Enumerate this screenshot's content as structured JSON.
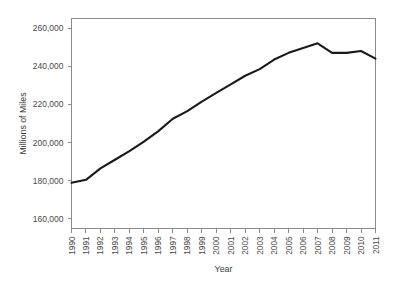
{
  "chart_data": {
    "type": "line",
    "title": "",
    "xlabel": "Year",
    "ylabel": "Millions of Miles",
    "x": [
      1990,
      1991,
      1992,
      1993,
      1994,
      1995,
      1996,
      1997,
      1998,
      1999,
      2000,
      2001,
      2002,
      2003,
      2004,
      2005,
      2006,
      2007,
      2008,
      2009,
      2010,
      2011
    ],
    "values": [
      179000,
      180500,
      186500,
      191000,
      195500,
      200500,
      206000,
      212500,
      216500,
      221500,
      226000,
      230500,
      235000,
      238500,
      243500,
      247000,
      249500,
      252000,
      247000,
      247000,
      248000,
      244000
    ],
    "series": [
      {
        "name": "Millions of Miles",
        "values": [
          179000,
          180500,
          186500,
          191000,
          195500,
          200500,
          206000,
          212500,
          216500,
          221500,
          226000,
          230500,
          235000,
          238500,
          243500,
          247000,
          249500,
          252000,
          247000,
          247000,
          248000,
          244000
        ]
      }
    ],
    "categories": [
      "1990",
      "1991",
      "1992",
      "1993",
      "1994",
      "1995",
      "1996",
      "1997",
      "1998",
      "1999",
      "2000",
      "2001",
      "2002",
      "2003",
      "2004",
      "2005",
      "2006",
      "2007",
      "2008",
      "2009",
      "2010",
      "2011"
    ],
    "xlim": [
      1990,
      2011
    ],
    "ylim": [
      155000,
      265000
    ],
    "y_ticks": [
      160000,
      180000,
      200000,
      220000,
      240000,
      260000
    ],
    "y_tick_labels": [
      "160,000",
      "180,000",
      "200,000",
      "220,000",
      "240,000",
      "260,000"
    ],
    "x_tick_labels": [
      "1990",
      "1991",
      "1992",
      "1993",
      "1994",
      "1995",
      "1996",
      "1997",
      "1998",
      "1999",
      "2000",
      "2001",
      "2002",
      "2003",
      "2004",
      "2005",
      "2006",
      "2007",
      "2008",
      "2009",
      "2010",
      "2011"
    ],
    "grid": false,
    "legend": false,
    "legend_position": "none",
    "line_color": "#1a1a1a",
    "axis_color": "#8b8b8b",
    "background_color": "#ffffff"
  }
}
